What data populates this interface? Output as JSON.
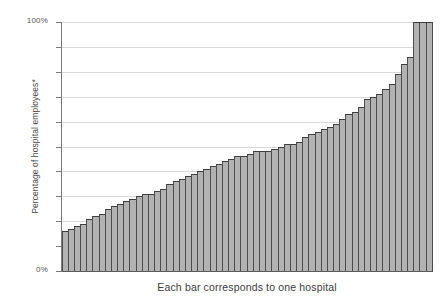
{
  "chart_data": {
    "type": "bar",
    "title": "",
    "subtitle": "",
    "xlabel": "Each bar corresponds to one hospital",
    "ylabel": "Percentage of hospital employees*",
    "ylim": [
      0,
      100
    ],
    "y_tick_labels": [
      "0%",
      "100%"
    ],
    "y_tick_label_bottom": "0%",
    "y_tick_label_top": "100%",
    "y_gridline_values": [
      10,
      20,
      30,
      40,
      50,
      60,
      70,
      80,
      90,
      100
    ],
    "grid": "horizontal",
    "legend": "none",
    "bar_fill_color": "#b2b2b2",
    "bar_edge_color": "#4d4d4d",
    "gridline_color": "#d8d8d8",
    "axis_color": "#5a5a5a",
    "background_color": "#ffffff",
    "categories": [
      "h1",
      "h2",
      "h3",
      "h4",
      "h5",
      "h6",
      "h7",
      "h8",
      "h9",
      "h10",
      "h11",
      "h12",
      "h13",
      "h14",
      "h15",
      "h16",
      "h17",
      "h18",
      "h19",
      "h20",
      "h21",
      "h22",
      "h23",
      "h24",
      "h25",
      "h26",
      "h27",
      "h28",
      "h29",
      "h30",
      "h31",
      "h32",
      "h33",
      "h34",
      "h35",
      "h36",
      "h37",
      "h38",
      "h39",
      "h40",
      "h41",
      "h42",
      "h43",
      "h44",
      "h45",
      "h46",
      "h47",
      "h48",
      "h49",
      "h50",
      "h51",
      "h52",
      "h53",
      "h54",
      "h55",
      "h56",
      "h57",
      "h58",
      "h59",
      "h60"
    ],
    "values": [
      16,
      17,
      18,
      19,
      21,
      22,
      23,
      25,
      26,
      27,
      28,
      29,
      30,
      31,
      31,
      32,
      33,
      35,
      36,
      37,
      38,
      39,
      40,
      41,
      42,
      43,
      44,
      45,
      46,
      46,
      47,
      48,
      48,
      48,
      49,
      50,
      51,
      51,
      52,
      54,
      55,
      56,
      57,
      58,
      59,
      61,
      63,
      64,
      66,
      69,
      70,
      71,
      73,
      75,
      79,
      83,
      86,
      100,
      100,
      100
    ]
  },
  "figure": {
    "footnote_marker": "*"
  }
}
